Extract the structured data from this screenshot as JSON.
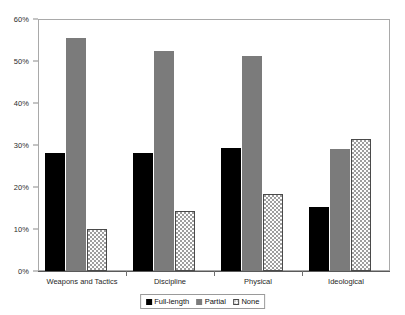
{
  "chart_data": {
    "type": "bar",
    "title": "",
    "subtitle": "",
    "xlabel": "",
    "ylabel": "",
    "categories": [
      "Weapons and Tactics",
      "Discipline",
      "Physical",
      "Ideological"
    ],
    "series": [
      {
        "name": "Full-length",
        "color": "#000000",
        "values": [
          28.2,
          28.2,
          29.2,
          15.2
        ]
      },
      {
        "name": "Partial",
        "color": "#7b7b7b",
        "values": [
          55.4,
          52.3,
          51.2,
          29.1
        ]
      },
      {
        "name": "None",
        "color": "#fdfdfd",
        "values": [
          10.1,
          14.2,
          18.4,
          31.4
        ]
      }
    ],
    "ylim": [
      0,
      60
    ],
    "y_ticks": [
      "0%",
      "10%",
      "20%",
      "30%",
      "40%",
      "50%",
      "60%"
    ],
    "y_tick_values": [
      0,
      10,
      20,
      30,
      40,
      50,
      60
    ],
    "grid": false,
    "legend_position": "bottom",
    "value_format": "percent"
  },
  "legend": {
    "items": [
      {
        "label": "Full-length",
        "swatch": "full-length"
      },
      {
        "label": "Partial",
        "swatch": "partial"
      },
      {
        "label": "None",
        "swatch": "none"
      }
    ]
  },
  "colors": {
    "full_length": "#000000",
    "partial": "#7b7b7b",
    "none_fill": "#fdfdfd",
    "none_border": "#4a4a4a",
    "axis": "#5a5a5a",
    "frame": "#a9a9a9",
    "text": "#1f1f1f"
  }
}
